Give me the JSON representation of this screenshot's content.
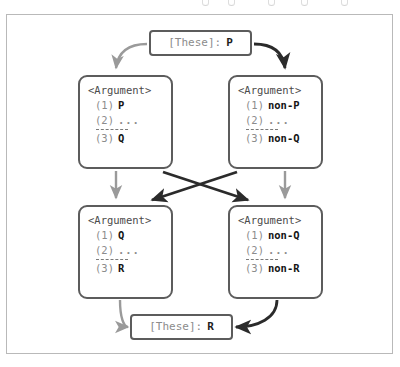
{
  "diagram": {
    "type": "argument-chain-flow",
    "colors": {
      "frame_border": "#b9b9b9",
      "node_border": "#5c5c5c",
      "arrow_dark": "#2b2b2b",
      "arrow_gray": "#9a9a9a",
      "label_gray": "#8c8c8c",
      "text_dark": "#141414",
      "background": "#ffffff"
    },
    "top_node": {
      "label": "[These]:",
      "value": "P",
      "full_text": "[These]: P"
    },
    "bottom_node": {
      "label": "[These]:",
      "value": "R",
      "full_text": "[These]: R"
    },
    "arguments": [
      {
        "id": "arg-top-left",
        "title": "<Argument>",
        "premises": [
          {
            "num": "(1)",
            "text": "P"
          },
          {
            "num": "(2)",
            "text": "..."
          }
        ],
        "separator": "-----",
        "conclusion": {
          "num": "(3)",
          "text": "Q"
        }
      },
      {
        "id": "arg-top-right",
        "title": "<Argument>",
        "premises": [
          {
            "num": "(1)",
            "text": "non-P"
          },
          {
            "num": "(2)",
            "text": "..."
          }
        ],
        "separator": "-----",
        "conclusion": {
          "num": "(3)",
          "text": "non-Q"
        }
      },
      {
        "id": "arg-bottom-left",
        "title": "<Argument>",
        "premises": [
          {
            "num": "(1)",
            "text": "Q"
          },
          {
            "num": "(2)",
            "text": "..."
          }
        ],
        "separator": "-----",
        "conclusion": {
          "num": "(3)",
          "text": "R"
        }
      },
      {
        "id": "arg-bottom-right",
        "title": "<Argument>",
        "premises": [
          {
            "num": "(1)",
            "text": "non-Q"
          },
          {
            "num": "(2)",
            "text": "..."
          }
        ],
        "separator": "-----",
        "conclusion": {
          "num": "(3)",
          "text": "non-R"
        }
      }
    ],
    "edges": [
      {
        "from": "top_node",
        "to": "arg-top-left",
        "style": "curve",
        "color": "gray"
      },
      {
        "from": "top_node",
        "to": "arg-top-right",
        "style": "curve",
        "color": "dark"
      },
      {
        "from": "arg-top-left",
        "to": "arg-bottom-left",
        "style": "straight",
        "color": "gray"
      },
      {
        "from": "arg-top-right",
        "to": "arg-bottom-right",
        "style": "straight",
        "color": "gray"
      },
      {
        "from": "arg-top-left",
        "to": "arg-bottom-right",
        "style": "diagonal",
        "color": "dark"
      },
      {
        "from": "arg-top-right",
        "to": "arg-bottom-left",
        "style": "diagonal",
        "color": "dark"
      },
      {
        "from": "arg-bottom-left",
        "to": "bottom_node",
        "style": "curve",
        "color": "gray"
      },
      {
        "from": "arg-bottom-right",
        "to": "bottom_node",
        "style": "curve",
        "color": "dark"
      }
    ]
  }
}
